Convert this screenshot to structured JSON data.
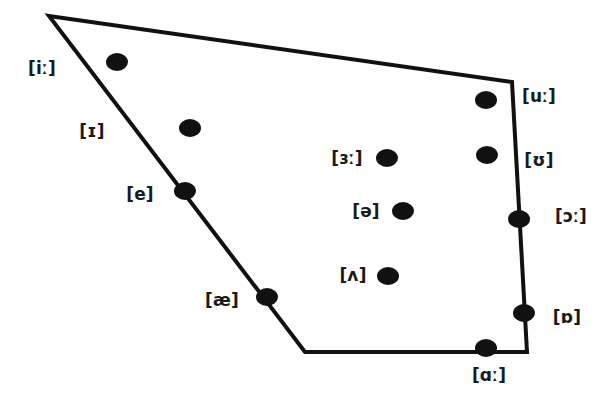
{
  "chart_data": {
    "type": "scatter",
    "title": "",
    "subtitle": "",
    "xlabel": "",
    "ylabel": "",
    "grid": false,
    "legend": "none",
    "xlim": [
      0,
      607
    ],
    "ylim": [
      412,
      0
    ],
    "outline": {
      "name": "vowel-quadrilateral",
      "stroke_color": "#111111",
      "stroke_width": 4,
      "fill_color": "#ffffff",
      "closed": true,
      "vertices": [
        {
          "name": "top-left-close-front",
          "x": 49,
          "y": 16
        },
        {
          "name": "top-right-close-back",
          "x": 512,
          "y": 82
        },
        {
          "name": "bottom-right-open-back",
          "x": 527,
          "y": 352
        },
        {
          "name": "bottom-left-open-front",
          "x": 305,
          "y": 352
        }
      ]
    },
    "dot_color": "#111111",
    "points": [
      {
        "symbol": "[iː]",
        "x": 117,
        "y": 62,
        "label_x": 42,
        "label_y": 68,
        "position": "interior",
        "height": "close",
        "backness": "front"
      },
      {
        "symbol": "[ɪ]",
        "x": 190,
        "y": 128,
        "label_x": 92,
        "label_y": 131,
        "position": "interior",
        "height": "near-close",
        "backness": "near-front"
      },
      {
        "symbol": "[e]",
        "x": 185,
        "y": 191,
        "label_x": 140,
        "label_y": 194,
        "position": "on-edge",
        "height": "close-mid",
        "backness": "front"
      },
      {
        "symbol": "[æ]",
        "x": 267,
        "y": 297,
        "label_x": 222,
        "label_y": 300,
        "position": "on-edge",
        "height": "near-open",
        "backness": "front"
      },
      {
        "symbol": "[ɜː]",
        "x": 387,
        "y": 158,
        "label_x": 347,
        "label_y": 158,
        "position": "interior",
        "height": "mid",
        "backness": "central"
      },
      {
        "symbol": "[ə]",
        "x": 403,
        "y": 211,
        "label_x": 366,
        "label_y": 211,
        "position": "interior",
        "height": "mid",
        "backness": "central"
      },
      {
        "symbol": "[ʌ]",
        "x": 388,
        "y": 276,
        "label_x": 353,
        "label_y": 275,
        "position": "interior",
        "height": "open-mid",
        "backness": "central"
      },
      {
        "symbol": "[uː]",
        "x": 486,
        "y": 100,
        "label_x": 539,
        "label_y": 96,
        "position": "interior",
        "height": "close",
        "backness": "back"
      },
      {
        "symbol": "[ʊ]",
        "x": 487,
        "y": 155,
        "label_x": 539,
        "label_y": 160,
        "position": "interior",
        "height": "near-close",
        "backness": "near-back"
      },
      {
        "symbol": "[ɔː]",
        "x": 519,
        "y": 219,
        "label_x": 571,
        "label_y": 216,
        "position": "on-edge",
        "height": "open-mid",
        "backness": "back"
      },
      {
        "symbol": "[ɒ]",
        "x": 524,
        "y": 313,
        "label_x": 567,
        "label_y": 317,
        "position": "on-edge",
        "height": "open",
        "backness": "back"
      },
      {
        "symbol": "[ɑː]",
        "x": 486,
        "y": 348,
        "label_x": 489,
        "label_y": 375,
        "position": "on-edge",
        "height": "open",
        "backness": "back"
      }
    ]
  }
}
